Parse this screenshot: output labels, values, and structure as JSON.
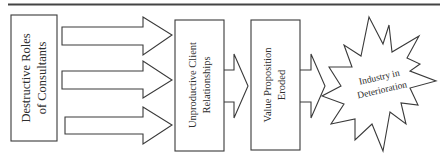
{
  "diagram": {
    "title_rule": true,
    "colors": {
      "stroke": "#3a3a3a",
      "text": "#2e2e2e",
      "fill": "#ffffff"
    },
    "nodes": [
      {
        "id": "n1",
        "shape": "rectangle",
        "lines": [
          "Destructive Roles",
          "of Consultants"
        ],
        "orientation": "vertical"
      },
      {
        "id": "n2",
        "shape": "rectangle",
        "lines": [
          "Unproductive Client",
          "Relationships"
        ],
        "orientation": "vertical"
      },
      {
        "id": "n3",
        "shape": "rectangle",
        "lines": [
          "Value Proposition",
          "Eroded"
        ],
        "orientation": "vertical"
      },
      {
        "id": "n4",
        "shape": "starburst",
        "lines": [
          "Industry in",
          "Deterioration"
        ],
        "orientation": "rotated"
      }
    ],
    "edges": [
      {
        "from": "n1",
        "to": "n2",
        "count": 3,
        "style": "block-arrow"
      },
      {
        "from": "n2",
        "to": "n3",
        "count": 1,
        "style": "block-arrow"
      },
      {
        "from": "n3",
        "to": "n4",
        "count": 1,
        "style": "block-arrow"
      }
    ]
  }
}
